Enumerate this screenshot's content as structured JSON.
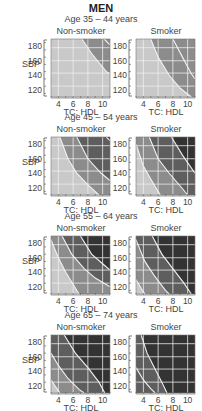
{
  "title": "MEN",
  "columns": [
    "Non-smoker",
    "Smoker"
  ],
  "x_label": "TC: HDL",
  "y_label": "SBP",
  "x_ticks": [
    4,
    6,
    8,
    10
  ],
  "y_ticks": [
    120,
    140,
    160,
    180
  ],
  "colors": {
    "band0": "#c9c9c9",
    "band1": "#8c8c8c",
    "band2": "#5e5e5e",
    "band3": "#333333",
    "grid": "#f0f0f0",
    "contour": "#f2f2f2",
    "axis": "#555555"
  },
  "chart_data": {
    "type": "heatmap",
    "title": "MEN",
    "xlabel": "TC: HDL",
    "ylabel": "SBP",
    "xlim": [
      3,
      11
    ],
    "ylim": [
      110,
      190
    ],
    "x_ticks": [
      4,
      6,
      8,
      10
    ],
    "y_ticks": [
      120,
      140,
      160,
      180
    ],
    "legend": "Shading bands indicate increasing cardiovascular risk (light to dark)",
    "panels": [
      {
        "age": "Age 35 – 44 years",
        "group": "Non-smoker",
        "contours": [
          [
            [
              7.2,
              190
            ],
            [
              8.5,
              170
            ],
            [
              10.5,
              145
            ],
            [
              11,
              142
            ]
          ],
          [
            [
              10.2,
              190
            ],
            [
              11,
              182
            ]
          ]
        ]
      },
      {
        "age": "Age 35 – 44 years",
        "group": "Smoker",
        "contours": [
          [
            [
              5,
              190
            ],
            [
              6,
              165
            ],
            [
              7.5,
              140
            ],
            [
              9,
              122
            ],
            [
              10.5,
              110
            ]
          ],
          [
            [
              8,
              190
            ],
            [
              9.3,
              165
            ],
            [
              10.5,
              142
            ],
            [
              11,
              135
            ]
          ]
        ]
      },
      {
        "age": "Age 45 – 54 years",
        "group": "Non-smoker",
        "contours": [
          [
            [
              4.2,
              190
            ],
            [
              5.3,
              160
            ],
            [
              6.5,
              140
            ],
            [
              8,
              124
            ],
            [
              9.5,
              110
            ]
          ],
          [
            [
              6.5,
              190
            ],
            [
              8,
              160
            ],
            [
              9.8,
              140
            ],
            [
              11,
              130
            ]
          ],
          [
            [
              10.5,
              190
            ],
            [
              11,
              185
            ]
          ]
        ]
      },
      {
        "age": "Age 45 – 54 years",
        "group": "Smoker",
        "contours": [
          [
            [
              3,
              180
            ],
            [
              4,
              150
            ],
            [
              5,
              132
            ],
            [
              6.3,
              110
            ]
          ],
          [
            [
              4.8,
              190
            ],
            [
              6,
              160
            ],
            [
              7.5,
              140
            ],
            [
              9.2,
              120
            ],
            [
              10,
              110
            ]
          ],
          [
            [
              7.8,
              190
            ],
            [
              9.3,
              165
            ],
            [
              11,
              140
            ]
          ]
        ]
      },
      {
        "age": "Age 55 – 64 years",
        "group": "Non-smoker",
        "contours": [
          [
            [
              3,
              185
            ],
            [
              4,
              160
            ],
            [
              5,
              140
            ],
            [
              6.2,
              120
            ],
            [
              6.8,
              110
            ]
          ],
          [
            [
              4.5,
              190
            ],
            [
              5.8,
              165
            ],
            [
              7.5,
              145
            ],
            [
              9,
              132
            ],
            [
              11,
              120
            ]
          ],
          [
            [
              7,
              190
            ],
            [
              8.5,
              165
            ],
            [
              10.2,
              150
            ],
            [
              11,
              143
            ]
          ]
        ]
      },
      {
        "age": "Age 55 – 64 years",
        "group": "Smoker",
        "contours": [
          [
            [
              3,
              130
            ],
            [
              3.7,
              118
            ],
            [
              4.2,
              110
            ]
          ],
          [
            [
              3,
              185
            ],
            [
              4.2,
              155
            ],
            [
              5.5,
              135
            ],
            [
              7,
              115
            ],
            [
              7.5,
              110
            ]
          ],
          [
            [
              5.2,
              190
            ],
            [
              6.5,
              165
            ],
            [
              8,
              145
            ],
            [
              9.5,
              125
            ],
            [
              10.5,
              110
            ]
          ]
        ]
      },
      {
        "age": "Age 65 – 74 years",
        "group": "Non-smoker",
        "contours": [
          [
            [
              3,
              128
            ],
            [
              3.8,
              116
            ],
            [
              4.2,
              110
            ]
          ],
          [
            [
              3,
              165
            ],
            [
              4,
              148
            ],
            [
              5.3,
              130
            ],
            [
              6.8,
              115
            ],
            [
              7.5,
              110
            ]
          ],
          [
            [
              4.8,
              190
            ],
            [
              6.3,
              165
            ],
            [
              8,
              145
            ],
            [
              9.5,
              125
            ],
            [
              10.3,
              110
            ]
          ]
        ]
      },
      {
        "age": "Age 65 – 74 years",
        "group": "Smoker",
        "contours": [
          [
            [
              3,
              145
            ],
            [
              4,
              128
            ],
            [
              5,
              116
            ],
            [
              5.6,
              110
            ]
          ],
          [
            [
              3.7,
              190
            ],
            [
              4.5,
              165
            ],
            [
              5.5,
              145
            ],
            [
              6.5,
              125
            ],
            [
              7.2,
              110
            ]
          ]
        ]
      }
    ]
  },
  "rows": [
    {
      "age": "Age 35 – 44 years",
      "panels": [
        {
          "bands": [
            "band0",
            "band1",
            "band2"
          ],
          "regions": [
            {
              "fill": "band1",
              "d": "M7.2,190 L8.5,170 L10.5,145 L11,142 L11,190 Z"
            }
          ],
          "contours": [
            [
              [
                7.2,
                190
              ],
              [
                8.5,
                170
              ],
              [
                10.5,
                145
              ],
              [
                11,
                142
              ]
            ],
            [
              [
                10.2,
                190
              ],
              [
                11,
                182
              ]
            ]
          ]
        },
        {
          "regions": [
            {
              "fill": "band1",
              "d": "M5,190 L6,165 L7.5,140 L9,122 L10.5,110 L11,110 L11,190 Z"
            }
          ],
          "contours": [
            [
              [
                5,
                190
              ],
              [
                6,
                165
              ],
              [
                7.5,
                140
              ],
              [
                9,
                122
              ],
              [
                10.5,
                110
              ]
            ],
            [
              [
                8,
                190
              ],
              [
                9.3,
                165
              ],
              [
                10.5,
                142
              ],
              [
                11,
                135
              ]
            ]
          ]
        }
      ]
    },
    {
      "age": "Age 45 – 54 years",
      "panels": [
        {
          "regions": [
            {
              "fill": "band1",
              "d": "M4.2,190 L5.3,160 L6.5,140 L8,124 L9.5,110 L11,110 L11,190 Z"
            },
            {
              "fill": "band2",
              "d": "M6.5,190 L8,160 L9.8,140 L11,130 L11,190 Z"
            },
            {
              "fill": "band3",
              "d": "M10.5,190 L11,185 L11,190 Z"
            }
          ],
          "contours": [
            [
              [
                4.2,
                190
              ],
              [
                5.3,
                160
              ],
              [
                6.5,
                140
              ],
              [
                8,
                124
              ],
              [
                9.5,
                110
              ]
            ],
            [
              [
                6.5,
                190
              ],
              [
                8,
                160
              ],
              [
                9.8,
                140
              ],
              [
                11,
                130
              ]
            ],
            [
              [
                10.5,
                190
              ],
              [
                11,
                185
              ]
            ]
          ]
        },
        {
          "regions": [
            {
              "fill": "band1",
              "d": "M3,180 L4,150 L5,132 L6.3,110 L11,110 L11,190 L3,190 Z"
            },
            {
              "fill": "band2",
              "d": "M4.8,190 L6,160 L7.5,140 L9.2,120 L10,110 L11,110 L11,190 Z"
            },
            {
              "fill": "band3",
              "d": "M7.8,190 L9.3,165 L11,140 L11,190 Z"
            }
          ],
          "contours": [
            [
              [
                3,
                180
              ],
              [
                4,
                150
              ],
              [
                5,
                132
              ],
              [
                6.3,
                110
              ]
            ],
            [
              [
                4.8,
                190
              ],
              [
                6,
                160
              ],
              [
                7.5,
                140
              ],
              [
                9.2,
                120
              ],
              [
                10,
                110
              ]
            ],
            [
              [
                7.8,
                190
              ],
              [
                9.3,
                165
              ],
              [
                11,
                140
              ]
            ]
          ]
        }
      ]
    },
    {
      "age": "Age 55 – 64 years",
      "panels": [
        {
          "regions": [
            {
              "fill": "band1",
              "d": "M3,185 L4,160 L5,140 L6.2,120 L6.8,110 L11,110 L11,190 L3,190 Z"
            },
            {
              "fill": "band2",
              "d": "M4.5,190 L5.8,165 L7.5,145 L9,132 L11,120 L11,190 Z"
            },
            {
              "fill": "band3",
              "d": "M7,190 L8.5,165 L10.2,150 L11,143 L11,190 Z"
            }
          ],
          "contours": [
            [
              [
                3,
                185
              ],
              [
                4,
                160
              ],
              [
                5,
                140
              ],
              [
                6.2,
                120
              ],
              [
                6.8,
                110
              ]
            ],
            [
              [
                4.5,
                190
              ],
              [
                5.8,
                165
              ],
              [
                7.5,
                145
              ],
              [
                9,
                132
              ],
              [
                11,
                120
              ]
            ],
            [
              [
                7,
                190
              ],
              [
                8.5,
                165
              ],
              [
                10.2,
                150
              ],
              [
                11,
                143
              ]
            ]
          ]
        },
        {
          "regions": [
            {
              "fill": "band1",
              "d": "M3,130 L3.7,118 L4.2,110 L11,110 L11,190 L3,190 Z"
            },
            {
              "fill": "band2",
              "d": "M3,185 L4.2,155 L5.5,135 L7,115 L7.5,110 L11,110 L11,190 L3,190 Z"
            },
            {
              "fill": "band3",
              "d": "M5.2,190 L6.5,165 L8,145 L9.5,125 L10.5,110 L11,110 L11,190 Z"
            }
          ],
          "contours": [
            [
              [
                3,
                130
              ],
              [
                3.7,
                118
              ],
              [
                4.2,
                110
              ]
            ],
            [
              [
                3,
                185
              ],
              [
                4.2,
                155
              ],
              [
                5.5,
                135
              ],
              [
                7,
                115
              ],
              [
                7.5,
                110
              ]
            ],
            [
              [
                5.2,
                190
              ],
              [
                6.5,
                165
              ],
              [
                8,
                145
              ],
              [
                9.5,
                125
              ],
              [
                10.5,
                110
              ]
            ]
          ]
        }
      ]
    },
    {
      "age": "Age 65 – 74 years",
      "panels": [
        {
          "regions": [
            {
              "fill": "band1",
              "d": "M3,128 L3.8,116 L4.2,110 L11,110 L11,190 L3,190 Z"
            },
            {
              "fill": "band2",
              "d": "M3,165 L4,148 L5.3,130 L6.8,115 L7.5,110 L11,110 L11,190 L3,190 Z"
            },
            {
              "fill": "band3",
              "d": "M4.8,190 L6.3,165 L8,145 L9.5,125 L10.3,110 L11,110 L11,190 Z"
            }
          ],
          "contours": [
            [
              [
                3,
                128
              ],
              [
                3.8,
                116
              ],
              [
                4.2,
                110
              ]
            ],
            [
              [
                3,
                165
              ],
              [
                4,
                148
              ],
              [
                5.3,
                130
              ],
              [
                6.8,
                115
              ],
              [
                7.5,
                110
              ]
            ],
            [
              [
                4.8,
                190
              ],
              [
                6.3,
                165
              ],
              [
                8,
                145
              ],
              [
                9.5,
                125
              ],
              [
                10.3,
                110
              ]
            ]
          ]
        },
        {
          "base": "band2",
          "regions": [
            {
              "fill": "band3",
              "d": "M3.7,190 L4.5,165 L5.5,145 L6.5,125 L7.2,110 L11,110 L11,190 Z"
            }
          ],
          "contours": [
            [
              [
                3,
                145
              ],
              [
                4,
                128
              ],
              [
                5,
                116
              ],
              [
                5.6,
                110
              ]
            ],
            [
              [
                3.7,
                190
              ],
              [
                4.5,
                165
              ],
              [
                5.5,
                145
              ],
              [
                6.5,
                125
              ],
              [
                7.2,
                110
              ]
            ]
          ]
        }
      ]
    }
  ]
}
